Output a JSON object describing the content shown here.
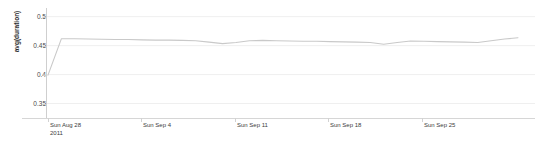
{
  "chart_data": {
    "type": "line",
    "title": "",
    "xlabel": "",
    "ylabel": "avg(duration)",
    "ylim": [
      0.325,
      0.515
    ],
    "yticks": [
      0.5,
      0.45,
      0.4,
      0.35
    ],
    "ytick_labels": [
      "0.5",
      "0.45",
      "0.4",
      "0.35"
    ],
    "grid": true,
    "grid_axis": "y",
    "legend": false,
    "xtick_labels": [
      "Sun Aug 28\n2011",
      "Sun Sep 4",
      "Sun Sep 11",
      "Sun Sep 18",
      "Sun Sep 25"
    ],
    "xtick_positions_px": [
      50,
      143,
      237,
      330,
      424
    ],
    "line_color": "#c9c9c9",
    "series": [
      {
        "name": "avg(duration)",
        "x": [
          0,
          1,
          2,
          3,
          4,
          5,
          6,
          7,
          8,
          9,
          10,
          11,
          12,
          13,
          14,
          15,
          16,
          17,
          18,
          19,
          20,
          21,
          22,
          23,
          24,
          25,
          26,
          27,
          28,
          29,
          30,
          31,
          32,
          33,
          34,
          35
        ],
        "values": [
          0.399,
          0.462,
          0.462,
          0.4615,
          0.461,
          0.4605,
          0.4605,
          0.46,
          0.4595,
          0.4595,
          0.459,
          0.4585,
          0.456,
          0.4535,
          0.4555,
          0.4585,
          0.459,
          0.4585,
          0.458,
          0.4575,
          0.4575,
          0.457,
          0.4565,
          0.456,
          0.4555,
          0.4525,
          0.4555,
          0.458,
          0.4575,
          0.457,
          0.4565,
          0.456,
          0.4555,
          0.4585,
          0.4615,
          0.4635
        ]
      }
    ]
  },
  "axis": {
    "y_title": "avg(duration)"
  }
}
